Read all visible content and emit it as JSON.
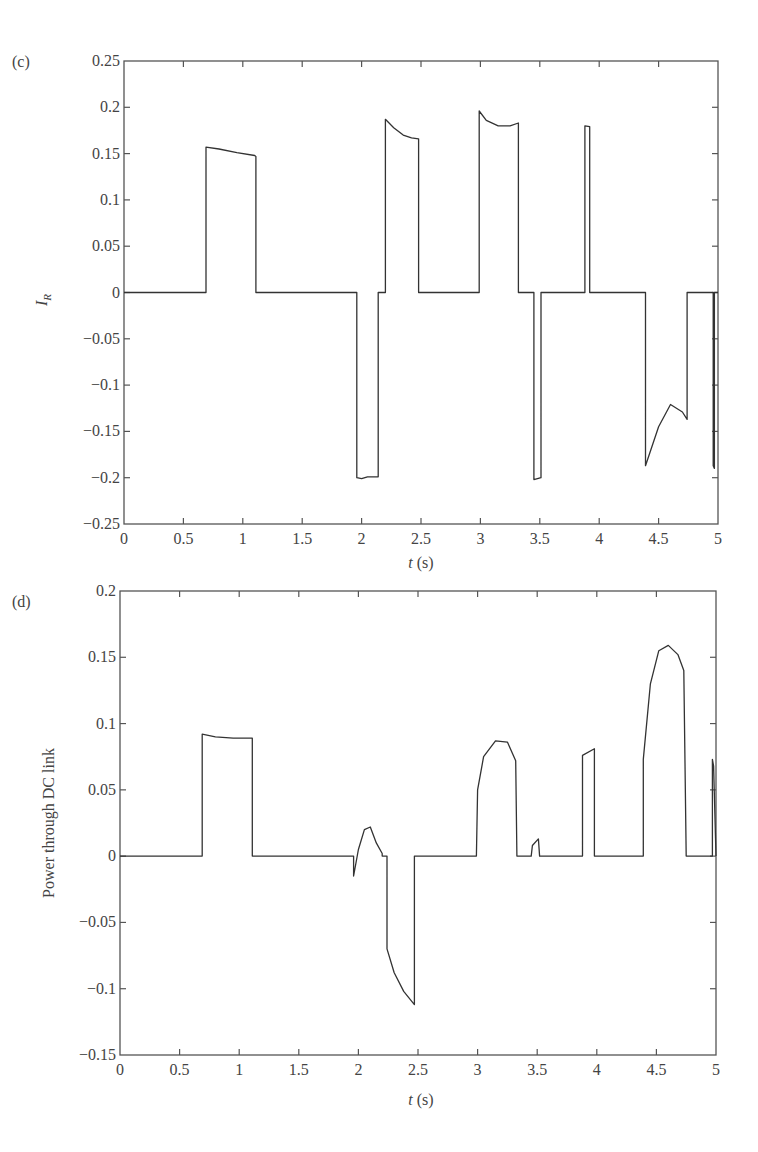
{
  "chart_data": [
    {
      "panel": "(c)",
      "type": "line",
      "title": "",
      "xlabel": "t (s)",
      "ylabel": "I_R",
      "xlim": [
        0,
        5
      ],
      "ylim": [
        -0.25,
        0.25
      ],
      "x_ticks": [
        "0",
        "0.5",
        "1",
        "1.5",
        "2",
        "2.5",
        "3",
        "3.5",
        "4",
        "4.5",
        "5"
      ],
      "y_ticks": [
        "0.25",
        "0.2",
        "0.15",
        "0.1",
        "0.05",
        "0",
        "-0.05",
        "-0.1",
        "-0.15",
        "-0.2",
        "-0.25"
      ],
      "grid": false,
      "legend": null,
      "series": [
        {
          "name": "I_R",
          "x": [
            0,
            0.69,
            0.69,
            0.8,
            0.95,
            1.1,
            1.11,
            1.11,
            1.96,
            1.96,
            2.0,
            2.05,
            2.14,
            2.14,
            2.2,
            2.2,
            2.27,
            2.35,
            2.42,
            2.48,
            2.48,
            2.99,
            2.99,
            3.05,
            3.15,
            3.25,
            3.32,
            3.32,
            3.45,
            3.45,
            3.51,
            3.51,
            3.88,
            3.88,
            3.92,
            3.92,
            4.39,
            4.39,
            4.5,
            4.6,
            4.7,
            4.74,
            4.74,
            4.96,
            4.96,
            4.97,
            4.97,
            5.0
          ],
          "y": [
            0,
            0,
            0.157,
            0.155,
            0.151,
            0.148,
            0.147,
            0,
            0,
            -0.2,
            -0.201,
            -0.199,
            -0.199,
            0,
            0,
            0.187,
            0.178,
            0.17,
            0.167,
            0.166,
            0,
            0,
            0.196,
            0.186,
            0.18,
            0.18,
            0.183,
            0,
            0,
            -0.202,
            -0.2,
            0,
            0,
            0.18,
            0.179,
            0,
            0,
            -0.187,
            -0.145,
            -0.121,
            -0.129,
            -0.137,
            0,
            0,
            -0.187,
            -0.19,
            0,
            0
          ]
        }
      ]
    },
    {
      "panel": "(d)",
      "type": "line",
      "title": "",
      "xlabel": "t (s)",
      "ylabel": "Power through DC link",
      "xlim": [
        0,
        5
      ],
      "ylim": [
        -0.15,
        0.2
      ],
      "x_ticks": [
        "0",
        "0.5",
        "1",
        "1.5",
        "2",
        "2.5",
        "3",
        "3.5",
        "4",
        "4.5",
        "5"
      ],
      "y_ticks": [
        "0.2",
        "0.15",
        "0.1",
        "0.05",
        "0",
        "-0.05",
        "-0.1",
        "-0.15"
      ],
      "grid": false,
      "legend": null,
      "series": [
        {
          "name": "Power through DC link",
          "x": [
            0,
            0.69,
            0.69,
            0.8,
            0.95,
            1.11,
            1.11,
            1.96,
            1.96,
            2.0,
            2.05,
            2.1,
            2.15,
            2.2,
            2.2,
            2.24,
            2.24,
            2.3,
            2.38,
            2.47,
            2.47,
            2.99,
            3.0,
            3.05,
            3.15,
            3.25,
            3.32,
            3.33,
            3.45,
            3.46,
            3.51,
            3.52,
            3.88,
            3.88,
            3.98,
            3.98,
            4.39,
            4.39,
            4.45,
            4.52,
            4.6,
            4.68,
            4.73,
            4.75,
            4.97,
            4.97,
            4.98,
            5.0
          ],
          "y": [
            0,
            0,
            0.092,
            0.09,
            0.089,
            0.089,
            0,
            0,
            -0.015,
            0.005,
            0.02,
            0.022,
            0.01,
            0.002,
            0,
            0,
            -0.07,
            -0.088,
            -0.102,
            -0.112,
            0,
            0,
            0.05,
            0.075,
            0.087,
            0.086,
            0.072,
            0,
            0,
            0.008,
            0.013,
            0,
            0,
            0.076,
            0.081,
            0,
            0,
            0.073,
            0.13,
            0.155,
            0.159,
            0.152,
            0.14,
            0,
            0,
            0.073,
            0.068,
            0
          ]
        }
      ]
    }
  ],
  "figure": {
    "panel_c_label": "(c)",
    "panel_d_label": "(d)",
    "c_ylabel_main": "I",
    "c_ylabel_sub": "R",
    "c_xlabel_italic": "t",
    "c_xlabel_unit": " (s)",
    "d_ylabel": "Power through DC link",
    "d_xlabel_italic": "t",
    "d_xlabel_unit": " (s)"
  }
}
